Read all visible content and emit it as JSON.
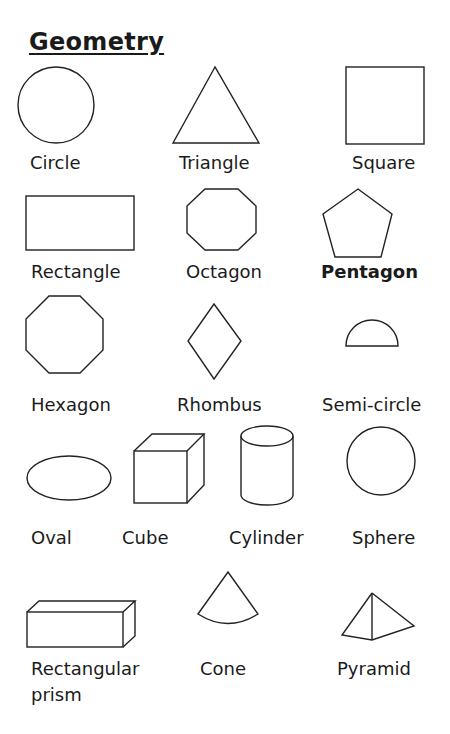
{
  "title": "Geometry",
  "shapes": [
    {
      "name": "Circle"
    },
    {
      "name": "Triangle"
    },
    {
      "name": "Square"
    },
    {
      "name": "Rectangle"
    },
    {
      "name": "Octagon"
    },
    {
      "name": "Pentagon"
    },
    {
      "name": "Hexagon"
    },
    {
      "name": "Rhombus"
    },
    {
      "name": "Semi-circle"
    },
    {
      "name": "Oval"
    },
    {
      "name": "Cube"
    },
    {
      "name": "Cylinder"
    },
    {
      "name": "Sphere"
    },
    {
      "name": "Rectangular prism",
      "line1": "Rectangular",
      "line2": "prism"
    },
    {
      "name": "Cone"
    },
    {
      "name": "Pyramid"
    }
  ]
}
